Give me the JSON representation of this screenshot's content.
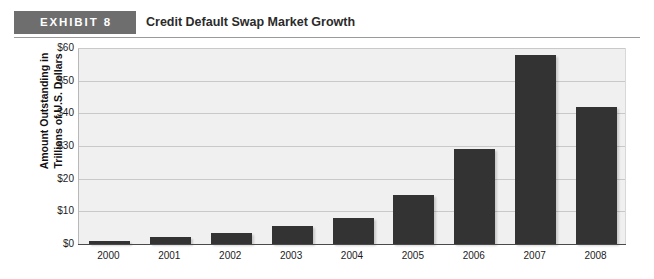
{
  "header": {
    "badge_label": "EXHIBIT 8",
    "title": "Credit Default Swap Market Growth",
    "badge_color": "#6e6e6e",
    "rule_color": "#9a9a9a"
  },
  "chart_data": {
    "type": "bar",
    "title": "Credit Default Swap Market Growth",
    "xlabel": "",
    "ylabel_line1": "Amount Outstanding in",
    "ylabel_line2": "Trillions of U.S. Dollars",
    "categories": [
      "2000",
      "2001",
      "2002",
      "2003",
      "2004",
      "2005",
      "2006",
      "2007",
      "2008"
    ],
    "values": [
      0.9,
      2,
      3.5,
      5.5,
      8,
      15,
      29,
      58,
      42
    ],
    "ylim": [
      0,
      60
    ],
    "ytick_values": [
      0,
      10,
      20,
      30,
      40,
      50,
      60
    ],
    "ytick_labels": [
      "$0",
      "$10",
      "$20",
      "$30",
      "$40",
      "$50",
      "$60"
    ],
    "grid": true,
    "legend": "none",
    "bar_color": "#333333",
    "plot_background": "#f0f0f0",
    "gridline_color": "#c9c9c9"
  }
}
